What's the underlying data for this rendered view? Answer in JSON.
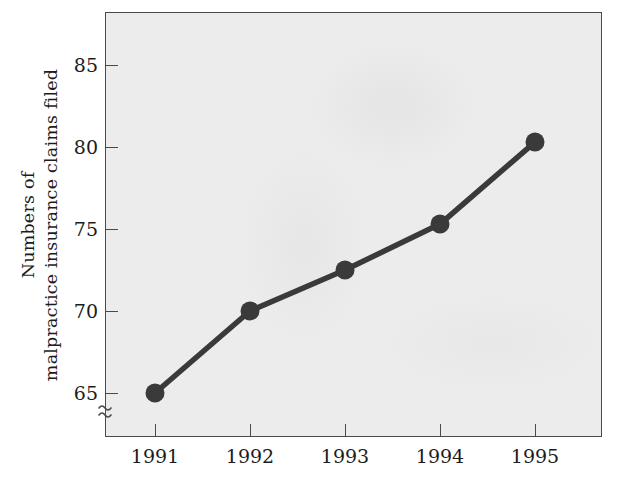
{
  "chart_data": {
    "type": "line",
    "title": "",
    "xlabel": "",
    "ylabel": "Numbers of malpractice insurance claims filed",
    "ylabel_lines": [
      "Numbers of",
      "malpractice insurance claims filed"
    ],
    "categories": [
      "1991",
      "1992",
      "1993",
      "1994",
      "1995"
    ],
    "x": [
      1991,
      1992,
      1993,
      1994,
      1995
    ],
    "values": [
      65.0,
      70.0,
      72.5,
      75.3,
      80.3
    ],
    "series": [
      {
        "name": "Numbers of malpractice insurance claims filed",
        "values": [
          65.0,
          70.0,
          72.5,
          75.3,
          80.3
        ]
      }
    ],
    "ylim": [
      63.0,
      87.0
    ],
    "yticks": [
      65,
      70,
      75,
      80,
      85
    ],
    "ytick_labels": [
      "65",
      "70",
      "75",
      "80",
      "85"
    ],
    "xticks": [
      1991,
      1992,
      1993,
      1994,
      1995
    ],
    "xtick_labels": [
      "1991",
      "1992",
      "1993",
      "1994",
      "1995"
    ],
    "grid": false,
    "legend": false,
    "legend_position": "none",
    "axis_break": {
      "axis": "y",
      "symbol": "≈",
      "below_value": 65,
      "note": "y-axis broken below 65"
    },
    "marker": "circle",
    "colors": {
      "line": "#3a3a3a",
      "marker": "#3a3a3a",
      "plot_background": "#ececec",
      "axis": "#4a4a4a",
      "text": "#1c1c1c",
      "page_background": "#ffffff"
    }
  }
}
